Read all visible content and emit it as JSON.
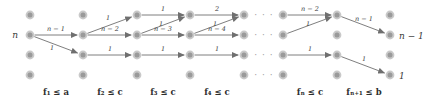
{
  "figure": {
    "colors": {
      "node_fill": "#9a9a9a",
      "node_ring": "#c9c9c9",
      "edge": "#6f6f6f",
      "text": "#3a3a3a",
      "background": "#ffffff"
    },
    "grid": {
      "rows_y": [
        15,
        35,
        55,
        75
      ],
      "cols_x": [
        30,
        83,
        137,
        190,
        244,
        283,
        337,
        390
      ],
      "ellipsis_x": 264
    },
    "terminal_labels": [
      {
        "name": "source-label",
        "text": "n",
        "x": 18,
        "y": 38
      },
      {
        "name": "sink-upper-label",
        "text": "n − 1",
        "x": 399,
        "y": 39
      },
      {
        "name": "sink-lower-label",
        "text": "1",
        "x": 399,
        "y": 79
      }
    ],
    "ellipsis": {
      "text": "· · ·",
      "rows_y": [
        15,
        35,
        55,
        75
      ]
    },
    "edges": [
      {
        "name": "edge-r2c1-r2c2",
        "label": "n − 1",
        "from": [
          30,
          35
        ],
        "to": [
          83,
          35
        ],
        "lx": 56,
        "ly": 31
      },
      {
        "name": "edge-r2c1-r3c2",
        "label": "1",
        "from": [
          30,
          35
        ],
        "to": [
          83,
          55
        ],
        "lx": 52,
        "ly": 50
      },
      {
        "name": "edge-r2c2-r1c3",
        "label": "1",
        "from": [
          83,
          35
        ],
        "to": [
          137,
          15
        ],
        "lx": 108,
        "ly": 20
      },
      {
        "name": "edge-r2c2-r2c3",
        "label": "n − 2",
        "from": [
          83,
          35
        ],
        "to": [
          137,
          35
        ],
        "lx": 110,
        "ly": 31
      },
      {
        "name": "edge-r3c2-r3c3",
        "label": "1",
        "from": [
          83,
          55
        ],
        "to": [
          137,
          55
        ],
        "lx": 110,
        "ly": 51
      },
      {
        "name": "edge-r1c3-r1c4",
        "label": "1",
        "from": [
          137,
          15
        ],
        "to": [
          190,
          15
        ],
        "lx": 163,
        "ly": 11
      },
      {
        "name": "edge-r2c3-r1c4",
        "label": "1",
        "from": [
          137,
          35
        ],
        "to": [
          190,
          15
        ],
        "lx": 161,
        "ly": 26
      },
      {
        "name": "edge-r2c3-r2c4",
        "label": "n − 3",
        "from": [
          137,
          35
        ],
        "to": [
          190,
          35
        ],
        "lx": 163,
        "ly": 31
      },
      {
        "name": "edge-r3c3-r3c4",
        "label": "1",
        "from": [
          137,
          55
        ],
        "to": [
          190,
          55
        ],
        "lx": 163,
        "ly": 51
      },
      {
        "name": "edge-r1c4-r1c5",
        "label": "2",
        "from": [
          190,
          15
        ],
        "to": [
          244,
          15
        ],
        "lx": 217,
        "ly": 11
      },
      {
        "name": "edge-r2c4-r1c5",
        "label": "1",
        "from": [
          190,
          35
        ],
        "to": [
          244,
          15
        ],
        "lx": 215,
        "ly": 26
      },
      {
        "name": "edge-r2c4-r2c5",
        "label": "n − 4",
        "from": [
          190,
          35
        ],
        "to": [
          244,
          35
        ],
        "lx": 217,
        "ly": 31
      },
      {
        "name": "edge-r3c4-r3c5",
        "label": "1",
        "from": [
          190,
          55
        ],
        "to": [
          244,
          55
        ],
        "lx": 217,
        "ly": 51
      },
      {
        "name": "edge-r1c6-r1c7",
        "label": "n − 2",
        "from": [
          283,
          15
        ],
        "to": [
          337,
          15
        ],
        "lx": 310,
        "ly": 11
      },
      {
        "name": "edge-r2c6-r1c7",
        "label": "1",
        "from": [
          283,
          35
        ],
        "to": [
          337,
          15
        ],
        "lx": 308,
        "ly": 26
      },
      {
        "name": "edge-r3c6-r3c7",
        "label": "1",
        "from": [
          283,
          55
        ],
        "to": [
          337,
          55
        ],
        "lx": 310,
        "ly": 51
      },
      {
        "name": "edge-r1c7-r2c8",
        "label": "n − 1",
        "from": [
          337,
          15
        ],
        "to": [
          390,
          35
        ],
        "lx": 364,
        "ly": 21
      },
      {
        "name": "edge-r3c7-r4c8",
        "label": "1",
        "from": [
          337,
          55
        ],
        "to": [
          390,
          75
        ],
        "lx": 364,
        "ly": 61
      }
    ],
    "capacity_labels": [
      {
        "name": "capacity-label-1",
        "text": "f₁ ≤ a",
        "x": 56
      },
      {
        "name": "capacity-label-2",
        "text": "f₂ ≤ c",
        "x": 110
      },
      {
        "name": "capacity-label-3",
        "text": "f₃ ≤ c",
        "x": 163
      },
      {
        "name": "capacity-label-4",
        "text": "f₄ ≤ c",
        "x": 217
      },
      {
        "name": "capacity-label-n",
        "text": "fₙ ≤ c",
        "x": 310
      },
      {
        "name": "capacity-label-n-plus-1",
        "text": "fₙ₊₁ ≤ b",
        "x": 364
      }
    ],
    "capacity_row_y": 95
  }
}
